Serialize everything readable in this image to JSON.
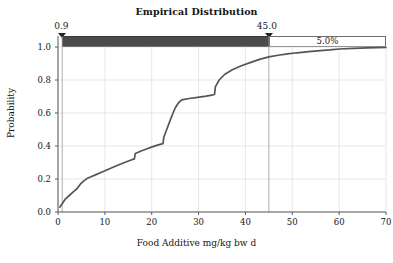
{
  "chart_data": {
    "type": "line",
    "title": "Empirical Distribution",
    "xlabel": "Food Additive mg/kg bw d",
    "ylabel": "Probability",
    "xlim": [
      0,
      70
    ],
    "ylim": [
      0,
      1.0
    ],
    "xticks": [
      0,
      10,
      20,
      30,
      40,
      50,
      60,
      70
    ],
    "xtick_labels": [
      "0",
      "10",
      "20",
      "30",
      "40",
      "50",
      "60",
      "70"
    ],
    "yticks": [
      0.0,
      0.2,
      0.4,
      0.6,
      0.8,
      1.0
    ],
    "ytick_labels": [
      "0.0",
      "0.2",
      "0.4",
      "0.6",
      "0.8",
      "1.0"
    ],
    "grid": true,
    "legend": "none",
    "series": [
      {
        "name": "Empirical CDF",
        "color": "#555555",
        "x": [
          0.4,
          0.9,
          1.6,
          2.4,
          3.2,
          4.0,
          4.8,
          5.6,
          6.3,
          6.9,
          8.0,
          9.4,
          11.0,
          12.6,
          14.2,
          15.6,
          16.3,
          16.5,
          17.6,
          19.0,
          20.4,
          21.6,
          22.4,
          22.6,
          23.4,
          24.2,
          25.0,
          25.8,
          26.4,
          28.0,
          29.8,
          31.6,
          32.8,
          33.4,
          33.6,
          34.4,
          35.6,
          37.2,
          39.0,
          41.0,
          43.0,
          45.0,
          47.0,
          49.0,
          51.0,
          53.5,
          56.0,
          58.0,
          60.0,
          63.0,
          66.0,
          70.0
        ],
        "y": [
          0.03,
          0.05,
          0.08,
          0.1,
          0.12,
          0.14,
          0.17,
          0.19,
          0.205,
          0.212,
          0.225,
          0.242,
          0.262,
          0.282,
          0.3,
          0.315,
          0.322,
          0.355,
          0.368,
          0.383,
          0.398,
          0.408,
          0.414,
          0.455,
          0.515,
          0.575,
          0.63,
          0.665,
          0.68,
          0.688,
          0.695,
          0.702,
          0.708,
          0.712,
          0.76,
          0.8,
          0.835,
          0.862,
          0.885,
          0.905,
          0.925,
          0.94,
          0.95,
          0.958,
          0.965,
          0.972,
          0.978,
          0.982,
          0.988,
          0.992,
          0.995,
          0.997
        ]
      }
    ],
    "interval_markers": {
      "low_label": "0.9",
      "low_value": 0.9,
      "high_label": "45.0",
      "high_value": 45.0,
      "tail_label": "5.0%",
      "band_dark_color": "#4b4b4b",
      "band_light_color": "#ffffff"
    },
    "reference_lines": [
      0.9,
      45.0
    ]
  }
}
